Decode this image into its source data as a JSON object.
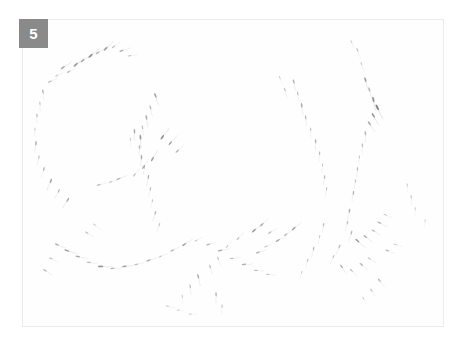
{
  "figure": {
    "panel_label": "5",
    "panel_label_badge_color": "#8a8a8a",
    "panel_label_text_color": "#ffffff",
    "panel_background_color": "#fefefe",
    "panel_border_color": "#ebebeb",
    "page_background_color": "#ffffff",
    "caption_alt": "Microscopy field panel 5: sparse dark comma-shaped particles on a near-white background",
    "mark_color": "#5a5a60",
    "mark_count": 132
  },
  "chart_data": {
    "type": "scatter",
    "title": "5",
    "xlabel": "",
    "ylabel": "",
    "xlim": [
      0,
      422
    ],
    "ylim": [
      0,
      308
    ],
    "grid": false,
    "legend": null,
    "marker": "dash",
    "marker_color": "#5a5a60",
    "series": [
      {
        "name": "upper-left-arc",
        "points": [
          [
            40,
            48,
            -35,
            5.0,
            0.55
          ],
          [
            46,
            52,
            -30,
            4.2,
            0.42
          ],
          [
            53,
            45,
            -40,
            5.5,
            0.6
          ],
          [
            60,
            41,
            -38,
            4.8,
            0.5
          ],
          [
            68,
            36,
            -42,
            5.8,
            0.65
          ],
          [
            75,
            33,
            -35,
            4.5,
            0.45
          ],
          [
            83,
            29,
            -45,
            5.2,
            0.58
          ],
          [
            91,
            27,
            -40,
            4.0,
            0.4
          ],
          [
            99,
            31,
            -20,
            4.6,
            0.48
          ],
          [
            107,
            36,
            -10,
            3.8,
            0.35
          ],
          [
            34,
            56,
            -28,
            3.6,
            0.33
          ],
          [
            27,
            62,
            -25,
            4.2,
            0.4
          ]
        ]
      },
      {
        "name": "left-vertical-chain",
        "points": [
          [
            20,
            72,
            80,
            4.4,
            0.45
          ],
          [
            17,
            84,
            85,
            3.8,
            0.36
          ],
          [
            14,
            96,
            88,
            4.0,
            0.4
          ],
          [
            12,
            110,
            90,
            3.4,
            0.3
          ],
          [
            13,
            124,
            95,
            4.6,
            0.5
          ],
          [
            16,
            138,
            100,
            3.9,
            0.38
          ],
          [
            21,
            150,
            105,
            4.3,
            0.44
          ],
          [
            28,
            162,
            110,
            5.0,
            0.55
          ],
          [
            36,
            172,
            115,
            4.1,
            0.4
          ],
          [
            45,
            181,
            120,
            4.8,
            0.52
          ]
        ]
      },
      {
        "name": "center-vertical-chain",
        "points": [
          [
            133,
            76,
            70,
            5.1,
            0.58
          ],
          [
            128,
            88,
            75,
            4.4,
            0.46
          ],
          [
            124,
            98,
            78,
            4.8,
            0.52
          ],
          [
            120,
            108,
            80,
            4.0,
            0.4
          ],
          [
            118,
            118,
            85,
            5.3,
            0.62
          ],
          [
            117,
            128,
            88,
            4.2,
            0.43
          ],
          [
            119,
            138,
            92,
            4.6,
            0.5
          ],
          [
            122,
            148,
            95,
            3.8,
            0.36
          ],
          [
            126,
            158,
            98,
            4.4,
            0.46
          ],
          [
            128,
            170,
            100,
            4.0,
            0.4
          ],
          [
            130,
            182,
            102,
            3.6,
            0.33
          ],
          [
            133,
            194,
            105,
            4.2,
            0.43
          ],
          [
            137,
            206,
            108,
            3.8,
            0.36
          ],
          [
            112,
            112,
            88,
            4.8,
            0.52
          ],
          [
            108,
            120,
            90,
            3.5,
            0.31
          ]
        ]
      },
      {
        "name": "center-mid-cluster",
        "points": [
          [
            140,
            118,
            -55,
            5.6,
            0.66
          ],
          [
            148,
            124,
            -50,
            5.0,
            0.56
          ],
          [
            155,
            132,
            -45,
            4.4,
            0.46
          ],
          [
            130,
            140,
            -60,
            5.2,
            0.58
          ],
          [
            121,
            148,
            -58,
            4.6,
            0.48
          ],
          [
            112,
            156,
            -55,
            4.0,
            0.4
          ],
          [
            96,
            160,
            -25,
            4.4,
            0.45
          ],
          [
            88,
            163,
            -20,
            3.8,
            0.36
          ],
          [
            76,
            166,
            -15,
            4.2,
            0.42
          ]
        ]
      },
      {
        "name": "lower-left-band",
        "points": [
          [
            34,
            226,
            20,
            4.6,
            0.48
          ],
          [
            44,
            232,
            15,
            5.2,
            0.58
          ],
          [
            55,
            238,
            10,
            4.8,
            0.52
          ],
          [
            66,
            244,
            5,
            4.2,
            0.42
          ],
          [
            78,
            248,
            0,
            5.6,
            0.64
          ],
          [
            90,
            250,
            -5,
            4.4,
            0.45
          ],
          [
            102,
            248,
            -10,
            5.0,
            0.54
          ],
          [
            114,
            246,
            -15,
            4.0,
            0.4
          ],
          [
            126,
            242,
            -20,
            4.6,
            0.48
          ],
          [
            138,
            238,
            -25,
            3.8,
            0.36
          ],
          [
            150,
            232,
            -30,
            4.4,
            0.44
          ],
          [
            162,
            226,
            -35,
            5.0,
            0.54
          ],
          [
            174,
            222,
            -30,
            3.6,
            0.33
          ],
          [
            186,
            226,
            -18,
            4.2,
            0.42
          ],
          [
            198,
            232,
            -12,
            4.8,
            0.5
          ],
          [
            210,
            240,
            -8,
            4.0,
            0.4
          ],
          [
            222,
            246,
            -4,
            4.6,
            0.48
          ],
          [
            234,
            252,
            2,
            4.2,
            0.42
          ],
          [
            246,
            256,
            6,
            3.8,
            0.36
          ],
          [
            64,
            214,
            30,
            4.0,
            0.38
          ],
          [
            72,
            206,
            35,
            3.6,
            0.32
          ],
          [
            28,
            240,
            25,
            3.8,
            0.36
          ],
          [
            22,
            252,
            30,
            4.2,
            0.42
          ]
        ]
      },
      {
        "name": "center-bottom-cluster",
        "points": [
          [
            232,
            212,
            -40,
            5.2,
            0.58
          ],
          [
            240,
            206,
            -45,
            4.6,
            0.48
          ],
          [
            248,
            214,
            -35,
            4.0,
            0.4
          ],
          [
            256,
            222,
            -30,
            4.8,
            0.5
          ],
          [
            264,
            216,
            -38,
            4.2,
            0.42
          ],
          [
            272,
            210,
            -42,
            5.0,
            0.54
          ],
          [
            244,
            228,
            -25,
            3.8,
            0.36
          ],
          [
            236,
            234,
            -20,
            4.4,
            0.45
          ],
          [
            216,
            220,
            -48,
            4.0,
            0.4
          ],
          [
            205,
            228,
            -50,
            3.6,
            0.33
          ],
          [
            176,
            258,
            75,
            4.8,
            0.5
          ],
          [
            168,
            268,
            80,
            4.0,
            0.4
          ],
          [
            160,
            278,
            85,
            3.6,
            0.33
          ],
          [
            188,
            248,
            70,
            4.2,
            0.42
          ],
          [
            196,
            240,
            65,
            3.8,
            0.36
          ],
          [
            194,
            276,
            88,
            4.4,
            0.45
          ],
          [
            200,
            288,
            90,
            3.8,
            0.35
          ],
          [
            145,
            288,
            10,
            3.6,
            0.32
          ],
          [
            156,
            292,
            5,
            3.2,
            0.28
          ],
          [
            168,
            296,
            0,
            3.4,
            0.3
          ]
        ]
      },
      {
        "name": "right-vertical-chain-a",
        "points": [
          [
            272,
            62,
            75,
            4.6,
            0.48
          ],
          [
            276,
            74,
            78,
            4.0,
            0.4
          ],
          [
            280,
            86,
            80,
            4.8,
            0.52
          ],
          [
            284,
            98,
            82,
            4.2,
            0.42
          ],
          [
            289,
            110,
            85,
            3.8,
            0.36
          ],
          [
            294,
            122,
            88,
            4.4,
            0.45
          ],
          [
            298,
            134,
            90,
            4.0,
            0.4
          ],
          [
            301,
            146,
            92,
            3.6,
            0.32
          ],
          [
            303,
            158,
            95,
            4.2,
            0.42
          ],
          [
            305,
            170,
            98,
            3.8,
            0.36
          ],
          [
            263,
            70,
            70,
            4.0,
            0.38
          ],
          [
            258,
            58,
            66,
            3.6,
            0.32
          ]
        ]
      },
      {
        "name": "right-vertical-chain-b",
        "points": [
          [
            344,
            60,
            72,
            5.2,
            0.58
          ],
          [
            348,
            70,
            74,
            4.6,
            0.48
          ],
          [
            352,
            80,
            76,
            5.8,
            0.68
          ],
          [
            356,
            88,
            62,
            6.4,
            0.75
          ],
          [
            352,
            96,
            58,
            5.6,
            0.64
          ],
          [
            348,
            104,
            55,
            5.0,
            0.54
          ],
          [
            344,
            114,
            85,
            4.4,
            0.45
          ],
          [
            341,
            126,
            88,
            4.0,
            0.4
          ],
          [
            338,
            138,
            90,
            3.6,
            0.33
          ],
          [
            336,
            150,
            92,
            4.2,
            0.42
          ],
          [
            334,
            162,
            95,
            3.8,
            0.36
          ],
          [
            332,
            174,
            98,
            4.4,
            0.45
          ],
          [
            336,
            30,
            68,
            4.0,
            0.38
          ],
          [
            340,
            44,
            70,
            3.6,
            0.33
          ],
          [
            330,
            22,
            66,
            3.4,
            0.3
          ]
        ]
      },
      {
        "name": "right-lower-cluster",
        "points": [
          [
            328,
            192,
            100,
            4.6,
            0.48
          ],
          [
            326,
            204,
            102,
            4.0,
            0.4
          ],
          [
            330,
            214,
            105,
            4.4,
            0.44
          ],
          [
            336,
            222,
            40,
            5.2,
            0.58
          ],
          [
            344,
            218,
            35,
            4.6,
            0.48
          ],
          [
            352,
            212,
            30,
            4.0,
            0.4
          ],
          [
            358,
            204,
            25,
            4.4,
            0.45
          ],
          [
            364,
            196,
            20,
            3.8,
            0.36
          ],
          [
            318,
            228,
            110,
            4.2,
            0.42
          ],
          [
            312,
            238,
            112,
            3.8,
            0.36
          ],
          [
            320,
            248,
            55,
            4.6,
            0.48
          ],
          [
            330,
            252,
            45,
            4.0,
            0.4
          ],
          [
            340,
            246,
            38,
            4.4,
            0.44
          ],
          [
            348,
            240,
            32,
            3.8,
            0.36
          ],
          [
            302,
            206,
            96,
            4.0,
            0.38
          ],
          [
            298,
            218,
            98,
            3.6,
            0.32
          ],
          [
            292,
            230,
            100,
            4.2,
            0.42
          ],
          [
            286,
            242,
            102,
            3.8,
            0.36
          ],
          [
            280,
            254,
            105,
            3.4,
            0.3
          ],
          [
            366,
            232,
            18,
            4.0,
            0.38
          ],
          [
            374,
            226,
            14,
            3.6,
            0.32
          ],
          [
            358,
            262,
            50,
            4.2,
            0.42
          ],
          [
            350,
            272,
            55,
            3.8,
            0.36
          ],
          [
            342,
            280,
            60,
            3.4,
            0.3
          ],
          [
            390,
            178,
            85,
            3.8,
            0.35
          ],
          [
            394,
            190,
            88,
            3.4,
            0.3
          ],
          [
            386,
            166,
            82,
            3.6,
            0.32
          ],
          [
            404,
            202,
            92,
            3.2,
            0.28
          ]
        ]
      }
    ]
  }
}
